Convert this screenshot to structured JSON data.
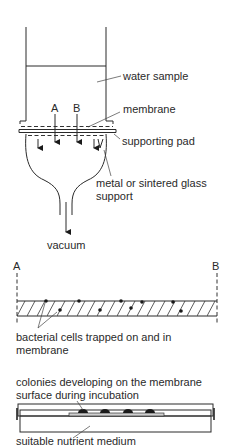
{
  "figure": {
    "panels": [
      {
        "id": "filtration-apparatus",
        "labels": {
          "water_sample": "water sample",
          "membrane": "membrane",
          "supporting_pad": "supporting pad",
          "support_line1": "metal or sintered glass",
          "support_line2": "support",
          "vacuum": "vacuum",
          "marker_a": "A",
          "marker_b": "B"
        }
      },
      {
        "id": "membrane-cross-section",
        "labels": {
          "marker_a": "A",
          "marker_b": "B",
          "cells_line1": "bacterial cells trapped on and in",
          "cells_line2": "membrane"
        }
      },
      {
        "id": "incubation-dish",
        "labels": {
          "colonies_line1": "colonies developing on the membrane",
          "colonies_line2": "surface during incubation",
          "medium": "suitable nutrient medium"
        }
      }
    ],
    "colors": {
      "line": "#2a2a2a",
      "background": "#ffffff"
    }
  }
}
